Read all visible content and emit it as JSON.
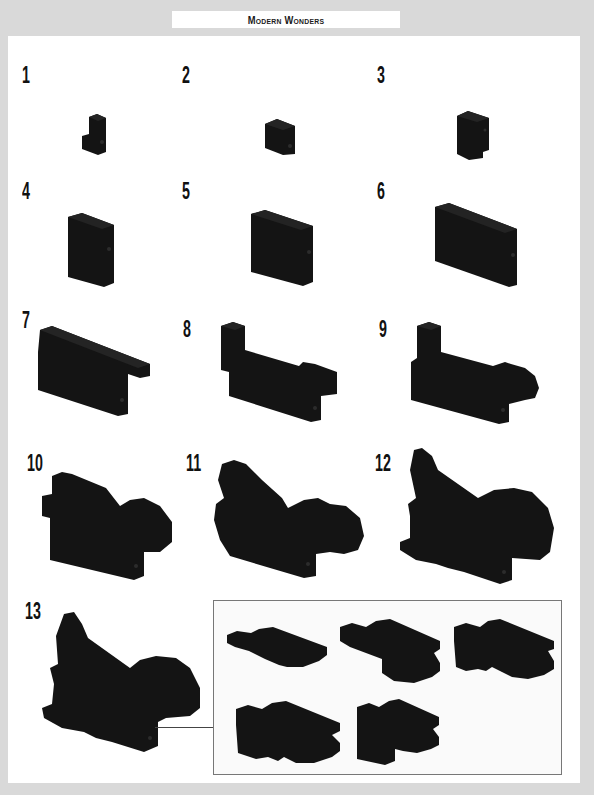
{
  "header": {
    "title": "Modern Wonders"
  },
  "colors": {
    "brick": "#141414",
    "brick_edge": "#2a2a2a",
    "page": "#ffffff",
    "margin": "#d9d9d9",
    "inset_border": "#777777"
  },
  "steps": [
    {
      "number": "1",
      "model": "1x1 stacked bricks with side stud"
    },
    {
      "number": "2",
      "model": "2x1 brick block"
    },
    {
      "number": "3",
      "model": "tall 3-high brick column"
    },
    {
      "number": "4",
      "model": "2-wide wall panel"
    },
    {
      "number": "5",
      "model": "3-wide wall panel"
    },
    {
      "number": "6",
      "model": "4-wide wall panel"
    },
    {
      "number": "7",
      "model": "wall with top plate and overhang"
    },
    {
      "number": "8",
      "model": "wall with raised back column and front block"
    },
    {
      "number": "9",
      "model": "wall with rounded head piece"
    },
    {
      "number": "10",
      "model": "body with sloped back and head"
    },
    {
      "number": "11",
      "model": "body with curved tail fin"
    },
    {
      "number": "12",
      "model": "body with rounded head and base plate"
    },
    {
      "number": "13",
      "model": "completed side of the sculpture"
    }
  ],
  "inset": {
    "label": "sub-assembly detail",
    "items": [
      {
        "id": "a",
        "model": "curved slope plate"
      },
      {
        "id": "b",
        "model": "double curved slope assembly"
      },
      {
        "id": "c",
        "model": "double slope with bracket"
      },
      {
        "id": "d",
        "model": "stacked slope wall"
      },
      {
        "id": "e",
        "model": "slope assembly with pillar"
      }
    ]
  }
}
